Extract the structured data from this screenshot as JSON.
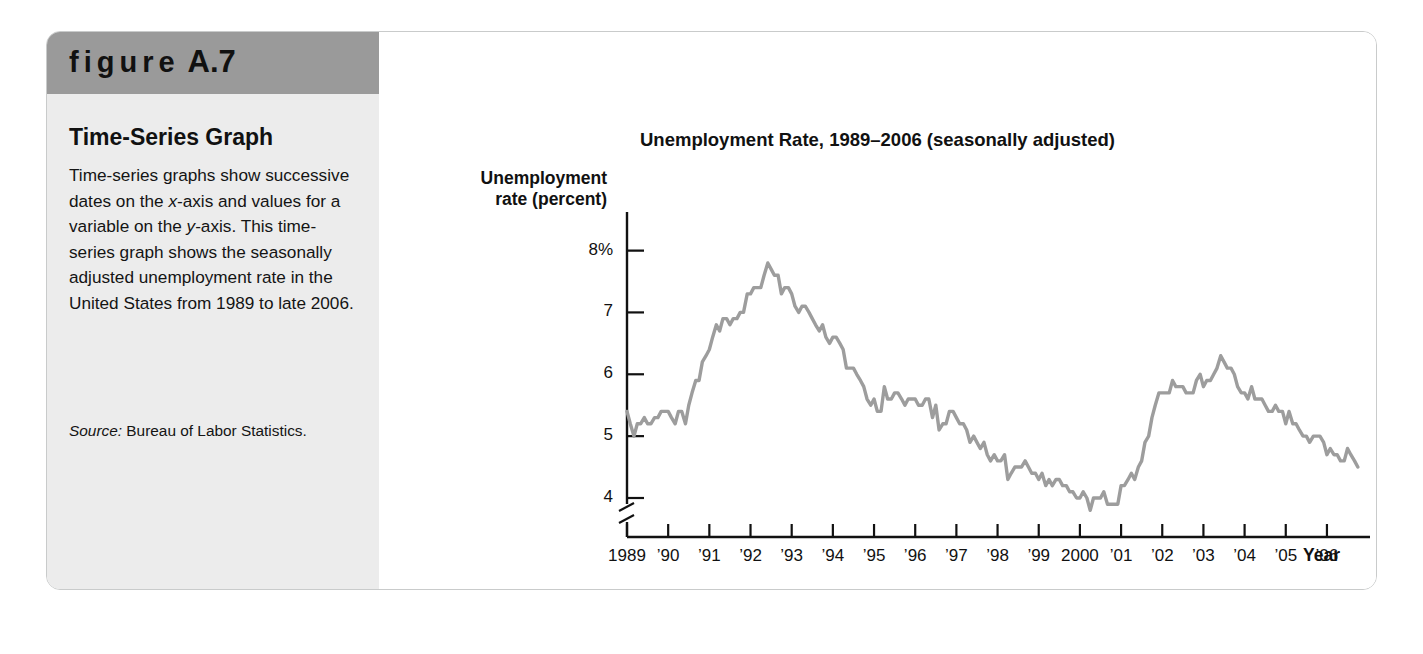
{
  "figure": {
    "label_prefix": "figure",
    "label_number": "A.7",
    "caption_title": "Time-Series Graph",
    "caption_body": "Time-series graphs show successive dates on the x-axis and values for a variable on the y-axis. This time-series graph shows the seasonally adjusted unemployment rate in the United States from 1989 to late 2006.",
    "source_label": "Source:",
    "source_text": "Bureau of Labor Statistics."
  },
  "colors": {
    "header_band": "#9a9a9a",
    "sidebar": "#ececec",
    "line": "#9d9d9d",
    "axis": "#111111",
    "card_border": "#c9cbcb"
  },
  "chart_data": {
    "type": "line",
    "title": "Unemployment Rate, 1989–2006 (seasonally adjusted)",
    "xlabel": "Year",
    "ylabel": "Unemployment rate (percent)",
    "ylim": [
      3.5,
      8.3
    ],
    "xlim": [
      1989.0,
      2006.9
    ],
    "grid": false,
    "legend": null,
    "axis_break_y": true,
    "ytick_labels": [
      "8%",
      "7",
      "6",
      "5",
      "4"
    ],
    "ytick_values": [
      8,
      7,
      6,
      5,
      4
    ],
    "xtick_labels": [
      "1989",
      "’90",
      "’91",
      "’92",
      "’93",
      "’94",
      "’95",
      "’96",
      "’97",
      "’98",
      "’99",
      "2000",
      "’01",
      "’02",
      "’03",
      "’04",
      "’05",
      "’06"
    ],
    "xtick_values": [
      1989,
      1990,
      1991,
      1992,
      1993,
      1994,
      1995,
      1996,
      1997,
      1998,
      1999,
      2000,
      2001,
      2002,
      2003,
      2004,
      2005,
      2006
    ],
    "series": [
      {
        "name": "Unemployment rate (percent)",
        "x": [
          1989.0,
          1989.08,
          1989.17,
          1989.25,
          1989.33,
          1989.42,
          1989.5,
          1989.58,
          1989.67,
          1989.75,
          1989.83,
          1989.92,
          1990.0,
          1990.08,
          1990.17,
          1990.25,
          1990.33,
          1990.42,
          1990.5,
          1990.58,
          1990.67,
          1990.75,
          1990.83,
          1990.92,
          1991.0,
          1991.08,
          1991.17,
          1991.25,
          1991.33,
          1991.42,
          1991.5,
          1991.58,
          1991.67,
          1991.75,
          1991.83,
          1991.92,
          1992.0,
          1992.08,
          1992.17,
          1992.25,
          1992.33,
          1992.42,
          1992.5,
          1992.58,
          1992.67,
          1992.75,
          1992.83,
          1992.92,
          1993.0,
          1993.08,
          1993.17,
          1993.25,
          1993.33,
          1993.42,
          1993.5,
          1993.58,
          1993.67,
          1993.75,
          1993.83,
          1993.92,
          1994.0,
          1994.08,
          1994.17,
          1994.25,
          1994.33,
          1994.42,
          1994.5,
          1994.58,
          1994.67,
          1994.75,
          1994.83,
          1994.92,
          1995.0,
          1995.08,
          1995.17,
          1995.25,
          1995.33,
          1995.42,
          1995.5,
          1995.58,
          1995.67,
          1995.75,
          1995.83,
          1995.92,
          1996.0,
          1996.08,
          1996.17,
          1996.25,
          1996.33,
          1996.42,
          1996.5,
          1996.58,
          1996.67,
          1996.75,
          1996.83,
          1996.92,
          1997.0,
          1997.08,
          1997.17,
          1997.25,
          1997.33,
          1997.42,
          1997.5,
          1997.58,
          1997.67,
          1997.75,
          1997.83,
          1997.92,
          1998.0,
          1998.08,
          1998.17,
          1998.25,
          1998.33,
          1998.42,
          1998.5,
          1998.58,
          1998.67,
          1998.75,
          1998.83,
          1998.92,
          1999.0,
          1999.08,
          1999.17,
          1999.25,
          1999.33,
          1999.42,
          1999.5,
          1999.58,
          1999.67,
          1999.75,
          1999.83,
          1999.92,
          2000.0,
          2000.08,
          2000.17,
          2000.25,
          2000.33,
          2000.42,
          2000.5,
          2000.58,
          2000.67,
          2000.75,
          2000.83,
          2000.92,
          2001.0,
          2001.08,
          2001.17,
          2001.25,
          2001.33,
          2001.42,
          2001.5,
          2001.58,
          2001.67,
          2001.75,
          2001.83,
          2001.92,
          2002.0,
          2002.08,
          2002.17,
          2002.25,
          2002.33,
          2002.42,
          2002.5,
          2002.58,
          2002.67,
          2002.75,
          2002.83,
          2002.92,
          2003.0,
          2003.08,
          2003.17,
          2003.25,
          2003.33,
          2003.42,
          2003.5,
          2003.58,
          2003.67,
          2003.75,
          2003.83,
          2003.92,
          2004.0,
          2004.08,
          2004.17,
          2004.25,
          2004.33,
          2004.42,
          2004.5,
          2004.58,
          2004.67,
          2004.75,
          2004.83,
          2004.92,
          2005.0,
          2005.08,
          2005.17,
          2005.25,
          2005.33,
          2005.42,
          2005.5,
          2005.58,
          2005.67,
          2005.75,
          2005.83,
          2005.92,
          2006.0,
          2006.08,
          2006.17,
          2006.25,
          2006.33,
          2006.42,
          2006.5,
          2006.58,
          2006.67,
          2006.75
        ],
        "y": [
          5.4,
          5.2,
          5.0,
          5.2,
          5.2,
          5.3,
          5.2,
          5.2,
          5.3,
          5.3,
          5.4,
          5.4,
          5.4,
          5.3,
          5.2,
          5.4,
          5.4,
          5.2,
          5.5,
          5.7,
          5.9,
          5.9,
          6.2,
          6.3,
          6.4,
          6.6,
          6.8,
          6.7,
          6.9,
          6.9,
          6.8,
          6.9,
          6.9,
          7.0,
          7.0,
          7.3,
          7.3,
          7.4,
          7.4,
          7.4,
          7.6,
          7.8,
          7.7,
          7.6,
          7.6,
          7.3,
          7.4,
          7.4,
          7.3,
          7.1,
          7.0,
          7.1,
          7.1,
          7.0,
          6.9,
          6.8,
          6.7,
          6.8,
          6.6,
          6.5,
          6.6,
          6.6,
          6.5,
          6.4,
          6.1,
          6.1,
          6.1,
          6.0,
          5.9,
          5.8,
          5.6,
          5.5,
          5.6,
          5.4,
          5.4,
          5.8,
          5.6,
          5.6,
          5.7,
          5.7,
          5.6,
          5.5,
          5.6,
          5.6,
          5.6,
          5.5,
          5.5,
          5.6,
          5.6,
          5.3,
          5.5,
          5.1,
          5.2,
          5.2,
          5.4,
          5.4,
          5.3,
          5.2,
          5.2,
          5.1,
          4.9,
          5.0,
          4.9,
          4.8,
          4.9,
          4.7,
          4.6,
          4.7,
          4.6,
          4.6,
          4.7,
          4.3,
          4.4,
          4.5,
          4.5,
          4.5,
          4.6,
          4.5,
          4.4,
          4.4,
          4.3,
          4.4,
          4.2,
          4.3,
          4.2,
          4.3,
          4.3,
          4.2,
          4.2,
          4.1,
          4.1,
          4.0,
          4.0,
          4.1,
          4.0,
          3.8,
          4.0,
          4.0,
          4.0,
          4.1,
          3.9,
          3.9,
          3.9,
          3.9,
          4.2,
          4.2,
          4.3,
          4.4,
          4.3,
          4.5,
          4.6,
          4.9,
          5.0,
          5.3,
          5.5,
          5.7,
          5.7,
          5.7,
          5.7,
          5.9,
          5.8,
          5.8,
          5.8,
          5.7,
          5.7,
          5.7,
          5.9,
          6.0,
          5.8,
          5.9,
          5.9,
          6.0,
          6.1,
          6.3,
          6.2,
          6.1,
          6.1,
          6.0,
          5.8,
          5.7,
          5.7,
          5.6,
          5.8,
          5.6,
          5.6,
          5.6,
          5.5,
          5.4,
          5.4,
          5.5,
          5.4,
          5.4,
          5.2,
          5.4,
          5.2,
          5.2,
          5.1,
          5.0,
          5.0,
          4.9,
          5.0,
          5.0,
          5.0,
          4.9,
          4.7,
          4.8,
          4.7,
          4.7,
          4.6,
          4.6,
          4.8,
          4.7,
          4.6,
          4.5
        ]
      }
    ]
  }
}
